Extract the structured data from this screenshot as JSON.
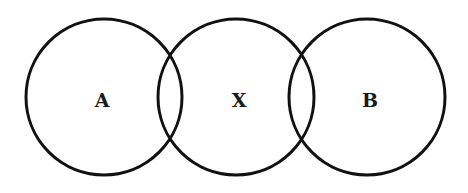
{
  "diagram": {
    "type": "venn-chain",
    "background": "#ffffff",
    "stroke_color": "#111111",
    "circles": [
      {
        "label": "A",
        "cx": 104,
        "cy": 97,
        "r": 78
      },
      {
        "label": "X",
        "cx": 236,
        "cy": 97,
        "r": 78
      },
      {
        "label": "B",
        "cx": 367,
        "cy": 97,
        "r": 78
      }
    ],
    "overlaps": [
      {
        "between": [
          "A",
          "X"
        ]
      },
      {
        "between": [
          "X",
          "B"
        ]
      }
    ]
  }
}
